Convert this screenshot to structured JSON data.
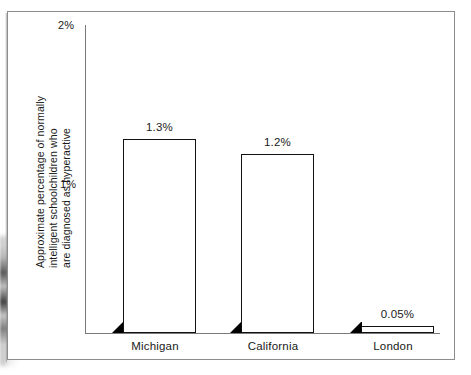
{
  "chart_data": {
    "type": "bar",
    "title": "",
    "subtitle": "",
    "xlabel": "",
    "ylabel": "Approximate percentage of normally intelligent schoolchildren who are diagnosed as hyperactive",
    "ylabel_lines": [
      "Approximate percentage of normally",
      "intelligent schoolchildren who",
      "are diagnosed as hyperactive"
    ],
    "categories": [
      "Michigan",
      "California",
      "London"
    ],
    "values": [
      1.3,
      1.2,
      0.05
    ],
    "value_labels": [
      "1.3%",
      "1.2%",
      "0.05%"
    ],
    "ylim": [
      0,
      2
    ],
    "yticks": [
      1,
      2
    ],
    "ytick_labels": [
      "1%",
      "2%"
    ],
    "grid": false,
    "legend": null,
    "style": {
      "bar_face_color": "#ffffff",
      "bar_edge_color": "#111111",
      "bar_side_color": "#000000",
      "axis_color": "#7a7a7a",
      "text_color": "#1a1a1a",
      "background": "#ffffff",
      "frame_color": "#8d8d8d"
    }
  },
  "figure": {
    "frame_label": "chart-frame"
  }
}
